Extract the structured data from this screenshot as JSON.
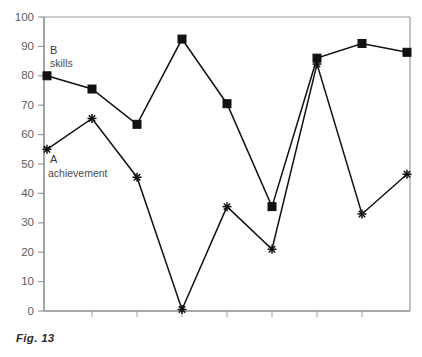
{
  "figure": {
    "caption": "Fig. 13"
  },
  "chart_data": {
    "type": "line",
    "title": "",
    "xlabel": "",
    "ylabel": "",
    "ylim": [
      0,
      100
    ],
    "ytick_step": 10,
    "yticks": [
      0,
      10,
      20,
      30,
      40,
      50,
      60,
      70,
      80,
      90,
      100
    ],
    "ytick_labels": [
      "0",
      "10",
      "20",
      "30",
      "40",
      "50",
      "60",
      "70",
      "80",
      "90",
      "100"
    ],
    "grid": false,
    "legend_position": "inline-annotation",
    "x": [
      1,
      2,
      3,
      4,
      5,
      6,
      7,
      8,
      9
    ],
    "xtick_labels": [
      "",
      "",
      "",
      "",
      "",
      "",
      "",
      "",
      ""
    ],
    "series": [
      {
        "name": "B",
        "label_line1": "B",
        "label_line2": "skills",
        "marker": "square",
        "color": "#111111",
        "values": [
          80,
          75.5,
          63.5,
          92.5,
          70.5,
          35.5,
          86,
          91,
          88
        ]
      },
      {
        "name": "A",
        "label_line1": "A",
        "label_line2": "achievement",
        "marker": "star",
        "color": "#111111",
        "values": [
          55,
          65.5,
          45.5,
          0.5,
          35.5,
          21,
          84,
          33,
          46.5
        ]
      }
    ]
  }
}
